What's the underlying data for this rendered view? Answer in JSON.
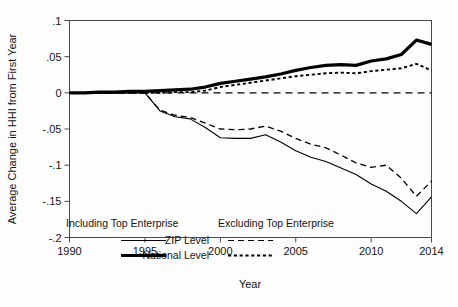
{
  "chart_data": {
    "type": "line",
    "title": "",
    "xlabel": "Year",
    "ylabel": "Average Change in HHI from First Year",
    "xlim": [
      1990,
      2014
    ],
    "ylim": [
      -0.2,
      0.1
    ],
    "grid": false,
    "legend_position": "inside-bottom-left",
    "x": [
      1990,
      1991,
      1992,
      1993,
      1994,
      1995,
      1996,
      1997,
      1998,
      1999,
      2000,
      2001,
      2002,
      2003,
      2004,
      2005,
      2006,
      2007,
      2008,
      2009,
      2010,
      2011,
      2012,
      2013,
      2014
    ],
    "xticks": [
      1990,
      1995,
      2000,
      2005,
      2010,
      2014
    ],
    "xticklabels": [
      "1990",
      "1995",
      "2000",
      "2005",
      "2010",
      "2014"
    ],
    "yticks": [
      0.1,
      0.05,
      0,
      -0.05,
      -0.1,
      -0.15,
      -0.2
    ],
    "yticklabels": [
      ".1",
      ".05",
      "0",
      "-.05",
      "-.1",
      "-.15",
      "-.2"
    ],
    "reference_line": {
      "y": 0,
      "style": "dashed"
    },
    "series": [
      {
        "name": "National Level",
        "group": "Including Top Enterprise",
        "style": "solid-thick",
        "values": [
          0.0,
          0.0,
          0.001,
          0.001,
          0.002,
          0.002,
          0.003,
          0.004,
          0.005,
          0.008,
          0.013,
          0.016,
          0.019,
          0.022,
          0.026,
          0.031,
          0.035,
          0.038,
          0.039,
          0.038,
          0.044,
          0.047,
          0.053,
          0.073,
          0.067
        ]
      },
      {
        "name": "ZIP Level",
        "group": "Including Top Enterprise",
        "style": "solid-thin",
        "values": [
          0.0,
          0.0,
          0.0,
          0.0,
          0.0,
          0.0,
          -0.025,
          -0.033,
          -0.036,
          -0.048,
          -0.062,
          -0.063,
          -0.063,
          -0.058,
          -0.068,
          -0.08,
          -0.089,
          -0.095,
          -0.104,
          -0.113,
          -0.126,
          -0.136,
          -0.15,
          -0.167,
          -0.144
        ]
      },
      {
        "name": "National Level",
        "group": "Excluding Top Enterprise",
        "style": "dotted",
        "values": [
          0.0,
          0.0,
          0.0,
          0.0,
          0.0,
          0.0,
          0.0,
          0.001,
          0.001,
          0.003,
          0.008,
          0.011,
          0.014,
          0.017,
          0.02,
          0.023,
          0.025,
          0.027,
          0.028,
          0.027,
          0.03,
          0.032,
          0.034,
          0.04,
          0.031
        ]
      },
      {
        "name": "ZIP Level",
        "group": "Excluding Top Enterprise",
        "style": "dashed",
        "values": [
          0.0,
          0.0,
          0.0,
          0.0,
          0.0,
          0.0,
          -0.024,
          -0.031,
          -0.034,
          -0.042,
          -0.05,
          -0.051,
          -0.05,
          -0.046,
          -0.053,
          -0.063,
          -0.071,
          -0.076,
          -0.086,
          -0.097,
          -0.103,
          -0.1,
          -0.118,
          -0.143,
          -0.122
        ]
      }
    ]
  },
  "legend": {
    "header_left": "Including Top Enterprise",
    "header_right": "Excluding Top Enterprise",
    "rows": [
      {
        "label": "ZIP Level",
        "left_style": "solid-thin",
        "right_style": "dashed"
      },
      {
        "label": "National Level",
        "left_style": "solid-thick",
        "right_style": "dotted"
      }
    ]
  },
  "colors": {
    "line": "#000000",
    "frame": "#4a4a4a",
    "background": "#fdfdfd",
    "text": "#141414"
  }
}
